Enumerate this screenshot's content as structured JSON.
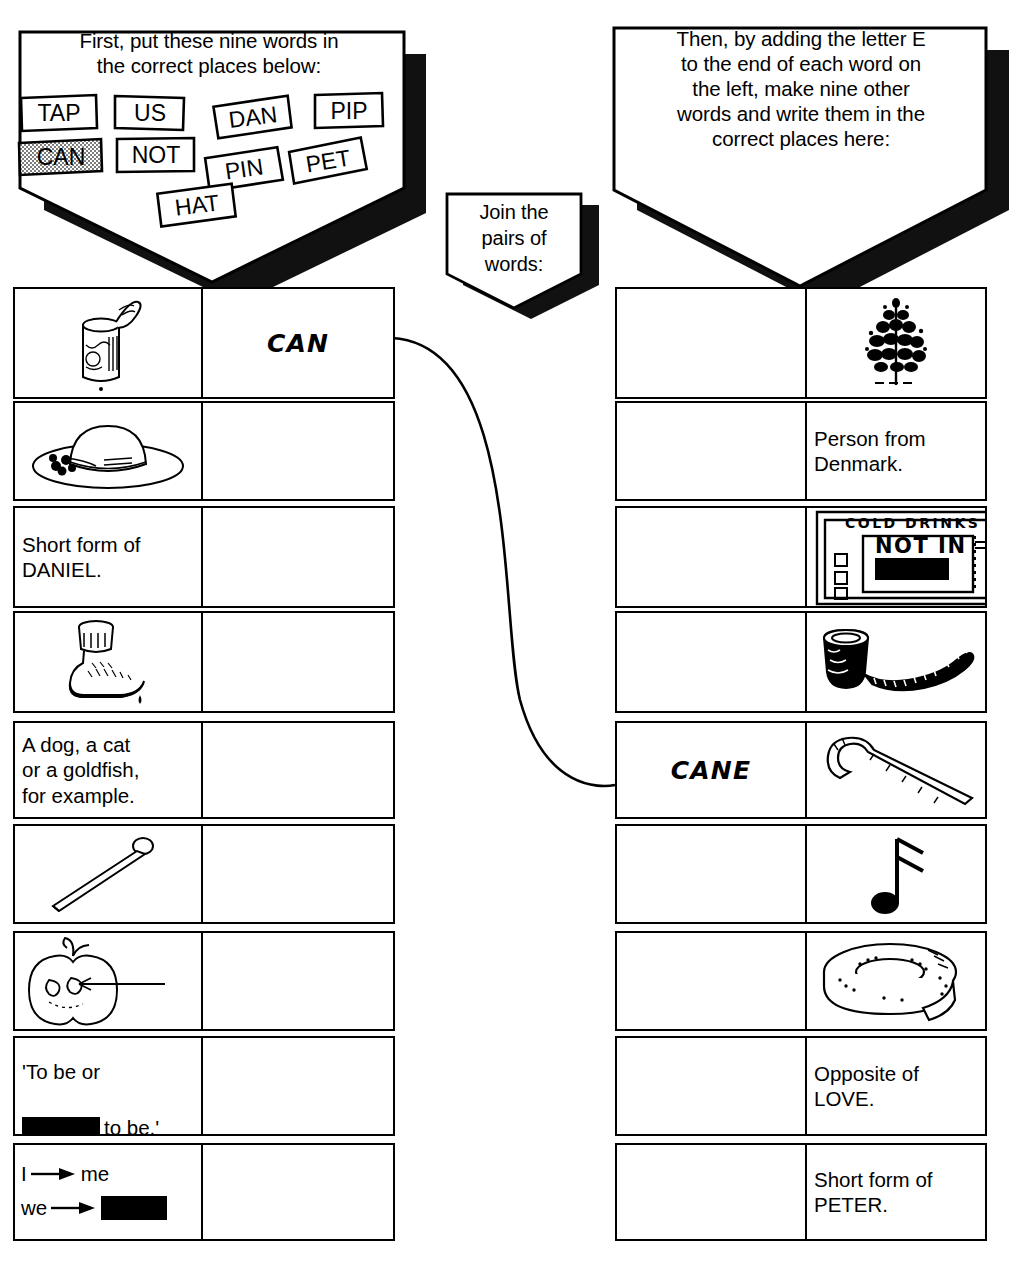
{
  "worksheet": {
    "instructions_left": "First, put these nine words in\nthe correct places below:",
    "instructions_middle": "Join the\npairs of\nwords:",
    "instructions_right": "Then, by adding the letter E\nto the end of each word on\nthe left, make nine other\nwords and write them in the\ncorrect places here:",
    "word_tiles": [
      {
        "label": "TAP",
        "used": false
      },
      {
        "label": "US",
        "used": false
      },
      {
        "label": "DAN",
        "used": false
      },
      {
        "label": "PIP",
        "used": false
      },
      {
        "label": "CAN",
        "used": true
      },
      {
        "label": "NOT",
        "used": false
      },
      {
        "label": "PIN",
        "used": false
      },
      {
        "label": "PET",
        "used": false
      },
      {
        "label": "HAT",
        "used": false
      }
    ]
  },
  "left_table": {
    "rows": [
      {
        "clue_type": "picture",
        "icon": "tin-can-icon",
        "clue_text": "",
        "answer": "CAN"
      },
      {
        "clue_type": "picture",
        "icon": "sun-hat-icon",
        "clue_text": "",
        "answer": ""
      },
      {
        "clue_type": "text",
        "icon": "",
        "clue_text": "Short form of\nDANIEL.",
        "answer": ""
      },
      {
        "clue_type": "picture",
        "icon": "water-tap-icon",
        "clue_text": "",
        "answer": ""
      },
      {
        "clue_type": "text",
        "icon": "",
        "clue_text": "A dog, a cat\nor a goldfish,\nfor example.",
        "answer": ""
      },
      {
        "clue_type": "picture",
        "icon": "pin-nail-icon",
        "clue_text": "",
        "answer": ""
      },
      {
        "clue_type": "picture",
        "icon": "apple-pip-icon",
        "clue_text": "",
        "answer": ""
      },
      {
        "clue_type": "text-redacted",
        "icon": "",
        "clue_text": "'To be or",
        "clue_text_2": "to be.'",
        "answer": ""
      },
      {
        "clue_type": "arrows",
        "icon": "",
        "line1_from": "I",
        "line1_to": "me",
        "line2_from": "we",
        "line2_to_redacted": true,
        "answer": ""
      }
    ]
  },
  "right_table": {
    "rows": [
      {
        "answer": "",
        "clue_type": "picture",
        "icon": "pine-tree-icon",
        "clue_text": ""
      },
      {
        "answer": "",
        "clue_type": "text",
        "icon": "",
        "clue_text": "Person from\nDenmark."
      },
      {
        "answer": "",
        "clue_type": "picture",
        "icon": "vending-machine-icon",
        "clue_text": "",
        "sign_top": "COLD DRINKS",
        "sign_mid": "NOT IN"
      },
      {
        "answer": "",
        "clue_type": "picture",
        "icon": "smoking-pipe-icon",
        "clue_text": ""
      },
      {
        "answer": "CANE",
        "clue_type": "picture",
        "icon": "walking-cane-icon",
        "clue_text": ""
      },
      {
        "answer": "",
        "clue_type": "picture",
        "icon": "music-note-icon",
        "clue_text": ""
      },
      {
        "answer": "",
        "clue_type": "picture",
        "icon": "hose-coil-icon",
        "clue_text": ""
      },
      {
        "answer": "",
        "clue_type": "text",
        "icon": "",
        "clue_text": "Opposite of\nLOVE."
      },
      {
        "answer": "",
        "clue_type": "text",
        "icon": "",
        "clue_text": "Short form of\nPETER."
      }
    ]
  },
  "colors": {
    "ink": "#000000",
    "paper": "#ffffff",
    "shadow": "#111111",
    "tile_used_fill": "#d8d8d8"
  }
}
